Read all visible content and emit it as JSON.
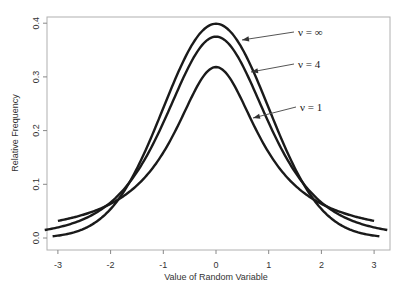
{
  "chart_data": {
    "type": "line",
    "title": "",
    "xlabel": "Value of Random Variable",
    "ylabel": "Relative Frequency",
    "xlim": [
      -3.3,
      3.3
    ],
    "ylim": [
      -0.02,
      0.42
    ],
    "x_ticks": [
      -3,
      -2,
      -1,
      0,
      1,
      2,
      3
    ],
    "x_tick_labels": [
      "-3",
      "-2",
      "-1",
      "0",
      "1",
      "2",
      "3"
    ],
    "y_ticks": [
      0.0,
      0.1,
      0.2,
      0.3,
      0.4
    ],
    "y_tick_labels": [
      "0.0",
      "0.1",
      "0.2",
      "0.3",
      "0.4"
    ],
    "grid": false,
    "legend": null,
    "series": [
      {
        "name": "ν = ∞",
        "distribution": "normal",
        "x_range": [
          -3.1,
          3.1
        ],
        "peak": 0.399,
        "x": [
          -3,
          -2,
          -1,
          0,
          1,
          2,
          3
        ],
        "values": [
          0.004,
          0.054,
          0.242,
          0.399,
          0.242,
          0.054,
          0.004
        ]
      },
      {
        "name": "ν = 4",
        "distribution": "t",
        "df": 4,
        "x_range": [
          -3.25,
          3.25
        ],
        "peak": 0.375,
        "x": [
          -3,
          -2,
          -1,
          0,
          1,
          2,
          3
        ],
        "values": [
          0.019,
          0.066,
          0.215,
          0.375,
          0.215,
          0.066,
          0.019
        ]
      },
      {
        "name": "ν = 1",
        "distribution": "t",
        "df": 1,
        "x_range": [
          -3.0,
          3.0
        ],
        "peak": 0.318,
        "x": [
          -3,
          -2,
          -1,
          0,
          1,
          2,
          3
        ],
        "values": [
          0.032,
          0.064,
          0.159,
          0.318,
          0.159,
          0.064,
          0.032
        ]
      }
    ],
    "annotations": [
      {
        "text": "ν = ∞",
        "label_xy_px": [
          298,
          36
        ],
        "arrow_tip_px": [
          242,
          40
        ]
      },
      {
        "text": "ν = 4",
        "label_xy_px": [
          298,
          68
        ],
        "arrow_tip_px": [
          251,
          72
        ]
      },
      {
        "text": "ν = 1",
        "label_xy_px": [
          300,
          111
        ],
        "arrow_tip_px": [
          253,
          118
        ]
      }
    ]
  }
}
